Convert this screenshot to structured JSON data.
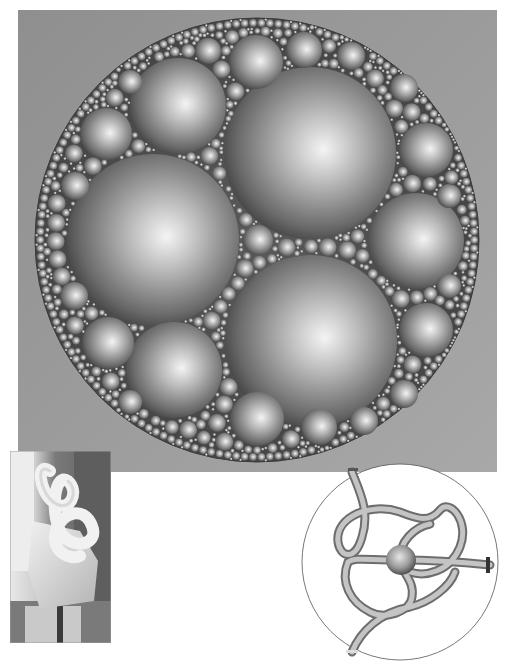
{
  "figure": {
    "packing": {
      "background_color": "#9a9a9a",
      "outer_circle": {
        "cx": 239,
        "cy": 230,
        "r": 222
      },
      "large_spheres": [
        {
          "cx": 292,
          "cy": 143,
          "r": 86
        },
        {
          "cx": 135,
          "cy": 230,
          "r": 86
        },
        {
          "cx": 293,
          "cy": 331,
          "r": 86
        },
        {
          "cx": 160,
          "cy": 96,
          "r": 48
        },
        {
          "cx": 156,
          "cy": 360,
          "r": 48
        },
        {
          "cx": 398,
          "cy": 231,
          "r": 48
        },
        {
          "cx": 240,
          "cy": 230,
          "r": 15
        }
      ],
      "medium_spheres": [
        {
          "cx": 238,
          "cy": 52,
          "r": 27
        },
        {
          "cx": 88,
          "cy": 124,
          "r": 26
        },
        {
          "cx": 90,
          "cy": 333,
          "r": 26
        },
        {
          "cx": 239,
          "cy": 409,
          "r": 27
        },
        {
          "cx": 408,
          "cy": 140,
          "r": 27
        },
        {
          "cx": 408,
          "cy": 320,
          "r": 27
        },
        {
          "cx": 286,
          "cy": 40,
          "r": 18
        },
        {
          "cx": 333,
          "cy": 46,
          "r": 14
        },
        {
          "cx": 190,
          "cy": 41,
          "r": 13
        },
        {
          "cx": 301,
          "cy": 417,
          "r": 18
        },
        {
          "cx": 346,
          "cy": 411,
          "r": 14
        },
        {
          "cx": 57,
          "cy": 176,
          "r": 14
        },
        {
          "cx": 56,
          "cy": 286,
          "r": 14
        },
        {
          "cx": 431,
          "cy": 186,
          "r": 12
        },
        {
          "cx": 431,
          "cy": 276,
          "r": 12
        },
        {
          "cx": 386,
          "cy": 78,
          "r": 14
        },
        {
          "cx": 386,
          "cy": 384,
          "r": 14
        },
        {
          "cx": 112,
          "cy": 72,
          "r": 12
        },
        {
          "cx": 112,
          "cy": 392,
          "r": 12
        }
      ]
    },
    "photo": {
      "subject": "white stone knot sculpture on pedestal",
      "background_color": "#6e6e6e"
    },
    "knot": {
      "outer_circle": {
        "cx": 100,
        "cy": 100,
        "r": 98
      },
      "tube_color": "#a9a9a9",
      "center_sphere": {
        "cx": 101,
        "cy": 98,
        "r": 15
      }
    }
  }
}
